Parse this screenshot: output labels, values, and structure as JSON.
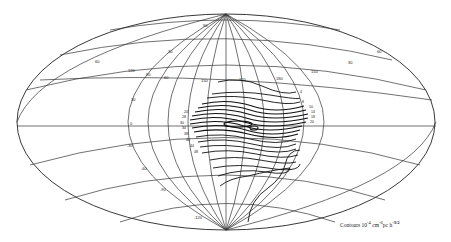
{
  "figure": {
    "type": "sky-map contour plot (Aitoff/Hammer equal-area projection)",
    "projection": "Hammer-Aitoff ellipse with overlaid rotated coordinate grid",
    "caption": {
      "prefix": "Contours 10",
      "exp1": "-4",
      "unit1": "cm",
      "exp2": "-6",
      "unit2": "pc h",
      "exp3": "-3/2"
    },
    "grid_labels": {
      "upper_band": [
        "60",
        "30",
        "120",
        "90",
        "60",
        "150",
        "120",
        "180",
        "150",
        "30",
        "60"
      ],
      "equator_band": [
        "0",
        "-30",
        "-60",
        "-90",
        "-120"
      ],
      "top": "90"
    },
    "contour_labels": [
      "4",
      "8",
      "10",
      "14",
      "18",
      "20",
      "24",
      "28",
      "30",
      "34",
      "38",
      "40",
      "44",
      "48"
    ],
    "colors": {
      "ink": "#111111",
      "grid": "#333333",
      "paper": "#ffffff"
    }
  }
}
